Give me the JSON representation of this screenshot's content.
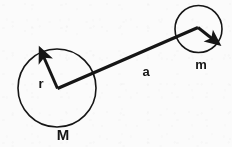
{
  "figure": {
    "background_color": "#fbfbfb",
    "ink_color": "#161616",
    "labels": {
      "large_mass": "M",
      "large_radius": "r",
      "separation": "a",
      "small_mass": "m"
    },
    "label_meanings": {
      "large_mass": "mass-of-primary-body",
      "large_radius": "radius-of-primary-body",
      "separation": "orbital-separation-distance",
      "small_mass": "mass-of-secondary-body"
    },
    "geometry": {
      "large_circle": {
        "cx": 57,
        "cy": 88,
        "r": 39,
        "stroke_width": 1.6
      },
      "small_circle": {
        "cx": 198.5,
        "cy": 29,
        "r": 23.5,
        "stroke_width": 1.6
      },
      "radius_vector": {
        "x1": 57.5,
        "y1": 88.5,
        "x2": 41,
        "y2": 51,
        "stroke_width": 3.0
      },
      "separation_vector": {
        "x1": 57.5,
        "y1": 88.5,
        "x2": 198,
        "y2": 27.5,
        "stroke_width": 3.2
      },
      "small_radius_vector": {
        "x1": 198,
        "y1": 27.5,
        "x2": 217,
        "y2": 42.5,
        "stroke_width": 3.0
      }
    },
    "label_positions": {
      "large_mass": {
        "x": 63,
        "y": 140,
        "size": 15
      },
      "large_radius": {
        "x": 41,
        "y": 88,
        "size": 13
      },
      "separation": {
        "x": 146,
        "y": 76,
        "size": 13
      },
      "small_mass": {
        "x": 201,
        "y": 69,
        "size": 13
      }
    }
  }
}
